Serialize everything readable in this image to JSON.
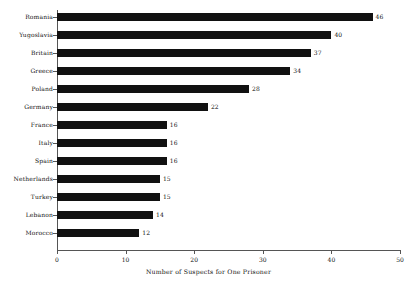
{
  "chart_data": {
    "type": "bar",
    "orientation": "horizontal",
    "title": "",
    "xlabel": "Number of Suspects for One Prisoner",
    "ylabel": "",
    "categories": [
      "Romania",
      "Yugoslavia",
      "Britain",
      "Greece",
      "Poland",
      "Germany",
      "France",
      "Italy",
      "Spain",
      "Netherlands",
      "Turkey",
      "Lebanon",
      "Morocco"
    ],
    "values": [
      46,
      40,
      37,
      34,
      28,
      22,
      16,
      16,
      16,
      15,
      15,
      14,
      12
    ],
    "value_labels": [
      "46",
      "40",
      "37",
      "34",
      "28",
      "22",
      "16",
      "16",
      "16",
      "15",
      "15",
      "14",
      "12"
    ],
    "xlim": [
      0,
      50
    ],
    "xticks": [
      0,
      10,
      20,
      30,
      40,
      50
    ],
    "xtick_labels": [
      "0",
      "10",
      "20",
      "30",
      "40",
      "50"
    ],
    "grid": false,
    "legend": false,
    "bar_color": "#111111",
    "background_color": "#ffffff",
    "axis_color": "#555555",
    "text_color": "#111111"
  }
}
